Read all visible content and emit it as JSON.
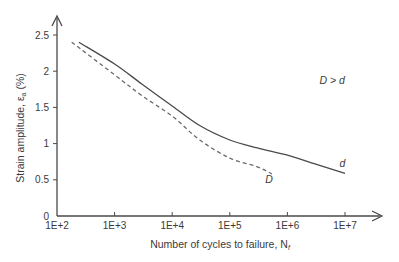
{
  "chart_data": {
    "type": "line",
    "title": "",
    "xlabel": "Number of cycles to failure, N",
    "xlabel_subscript": "f",
    "ylabel": "Strain amplitude, ε",
    "ylabel_subscript": "a",
    "ylabel_suffix": " (%)",
    "x_scale": "log10",
    "xlim": [
      100,
      10000000
    ],
    "ylim": [
      0,
      2.5
    ],
    "x_ticks": [
      100,
      1000,
      10000,
      100000,
      1000000,
      10000000
    ],
    "x_tick_labels": [
      "1E+2",
      "1E+3",
      "1E+4",
      "1E+5",
      "1E+6",
      "1E+7"
    ],
    "y_ticks": [
      0,
      0.5,
      1,
      1.5,
      2,
      2.5
    ],
    "y_tick_labels": [
      "0",
      "0.5",
      "1",
      "1.5",
      "2",
      "2.5"
    ],
    "grid": false,
    "series": [
      {
        "name": "d",
        "style": "solid",
        "color": "#4a4a4a",
        "x": [
          240,
          1000,
          3000,
          10000,
          30000,
          100000,
          300000,
          1000000,
          3000000,
          10000000
        ],
        "y": [
          2.4,
          2.1,
          1.82,
          1.52,
          1.25,
          1.05,
          0.94,
          0.84,
          0.72,
          0.59
        ]
      },
      {
        "name": "D",
        "style": "dashed",
        "color": "#6a6a6a",
        "x": [
          180,
          1000,
          3000,
          10000,
          30000,
          100000,
          300000,
          540000
        ],
        "y": [
          2.4,
          1.95,
          1.66,
          1.38,
          1.05,
          0.8,
          0.68,
          0.58
        ]
      }
    ],
    "annotations": [
      {
        "text": "d",
        "x": 9000000,
        "y": 0.68
      },
      {
        "text": "D",
        "x": 480000,
        "y": 0.45
      },
      {
        "text": "D > d",
        "x": 6000000,
        "y": 1.82
      }
    ]
  }
}
